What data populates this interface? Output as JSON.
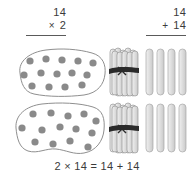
{
  "page": {
    "background": "#ffffff",
    "ink": "#3b3b3b",
    "outline_color": "#8f8f8f",
    "dot_color": "#8a8a8a",
    "stick_fill": "#dcdcdc",
    "stick_stroke": "#9a9a9a",
    "band_color": "#2b2b2b"
  },
  "equations": {
    "multiplication": {
      "name": "multiplication-problem",
      "top": "14",
      "operator": "×",
      "bottom": "2",
      "has_rule": true
    },
    "addition": {
      "name": "addition-problem",
      "top": "14",
      "operator": "+",
      "bottom": "14",
      "has_rule": true
    }
  },
  "number_sentence": {
    "text": "2 × 14 = 14 + 14"
  },
  "models": {
    "counter_groups": [
      {
        "label": "group-1",
        "dot_count": 14,
        "dots": [
          [
            22,
            14
          ],
          [
            38,
            12
          ],
          [
            54,
            13
          ],
          [
            70,
            14
          ],
          [
            85,
            16
          ],
          [
            16,
            28
          ],
          [
            33,
            26
          ],
          [
            49,
            27
          ],
          [
            64,
            26
          ],
          [
            79,
            28
          ],
          [
            24,
            39
          ],
          [
            41,
            40
          ],
          [
            57,
            40
          ],
          [
            74,
            38
          ]
        ]
      },
      {
        "label": "group-2",
        "dot_count": 14,
        "dots": [
          [
            25,
            13
          ],
          [
            43,
            12
          ],
          [
            60,
            15
          ],
          [
            76,
            13
          ],
          [
            88,
            18
          ],
          [
            14,
            26
          ],
          [
            34,
            29
          ],
          [
            52,
            26
          ],
          [
            68,
            28
          ],
          [
            84,
            31
          ],
          [
            27,
            41
          ],
          [
            45,
            43
          ],
          [
            62,
            40
          ],
          [
            80,
            47
          ]
        ]
      }
    ],
    "stick_groups": [
      {
        "label": "sticks-row-1",
        "bundle_count": 1,
        "sticks_per_bundle": 10,
        "loose_sticks": 4,
        "total": 14
      },
      {
        "label": "sticks-row-2",
        "bundle_count": 1,
        "sticks_per_bundle": 10,
        "loose_sticks": 4,
        "total": 14
      }
    ]
  }
}
